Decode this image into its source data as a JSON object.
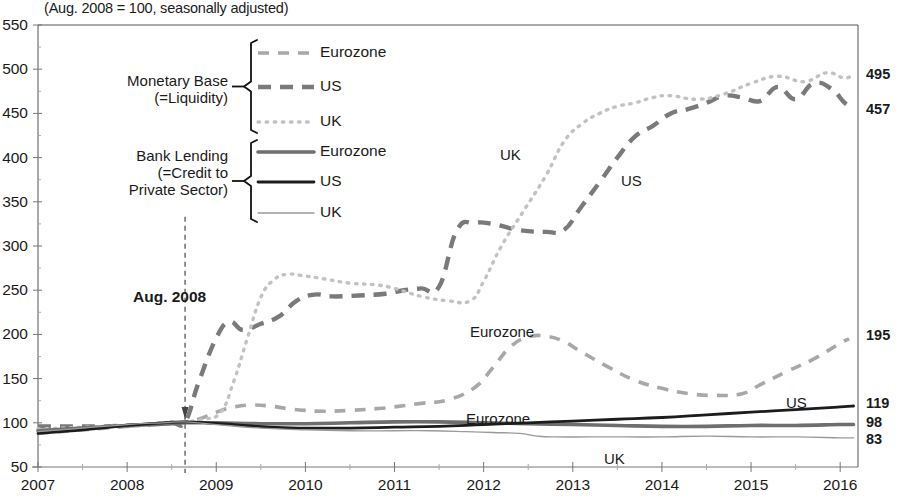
{
  "subtitle": "(Aug. 2008 = 100, seasonally adjusted)",
  "annotation": {
    "aug2008": "Aug. 2008"
  },
  "legend": {
    "groups": [
      {
        "name": "monetary-base",
        "line1": "Monetary Base",
        "line2": "(=Liquidity)",
        "line3": "",
        "items": [
          {
            "label": "Eurozone",
            "style": "dashed-light"
          },
          {
            "label": "US",
            "style": "dashed-medium"
          },
          {
            "label": "UK",
            "style": "dotted-light"
          }
        ]
      },
      {
        "name": "bank-lending",
        "line1": "Bank Lending",
        "line2": "(=Credit to",
        "line3": "Private Sector)",
        "items": [
          {
            "label": "Eurozone",
            "style": "solid-thick-grey"
          },
          {
            "label": "US",
            "style": "solid-thick-dark"
          },
          {
            "label": "UK",
            "style": "solid-thin-grey"
          }
        ]
      }
    ]
  },
  "inline_labels": [
    {
      "text": "UK",
      "x": 500,
      "y": 146
    },
    {
      "text": "US",
      "x": 621,
      "y": 172
    },
    {
      "text": "Eurozone",
      "x": 470,
      "y": 323
    },
    {
      "text": "Eurozone",
      "x": 466,
      "y": 410
    },
    {
      "text": "US",
      "x": 786,
      "y": 394
    },
    {
      "text": "UK",
      "x": 604,
      "y": 450
    }
  ],
  "right_labels": [
    {
      "value": "495",
      "y": 75
    },
    {
      "value": "457",
      "y": 110
    },
    {
      "value": "195",
      "y": 336
    },
    {
      "value": "119",
      "y": 404
    },
    {
      "value": "98",
      "y": 423
    },
    {
      "value": "83",
      "y": 440
    }
  ],
  "chart_data": {
    "type": "line",
    "title": "",
    "subtitle": "(Aug. 2008 = 100, seasonally adjusted)",
    "xlabel": "",
    "ylabel": "",
    "xlim": [
      2007.0,
      2016.2
    ],
    "ylim": [
      50,
      550
    ],
    "yticks": [
      50,
      100,
      150,
      200,
      250,
      300,
      350,
      400,
      450,
      500,
      550
    ],
    "xticks": [
      2007,
      2008,
      2009,
      2010,
      2011,
      2012,
      2013,
      2014,
      2015,
      2016
    ],
    "grid": false,
    "legend_position": "inside-upper-left",
    "vline": {
      "x": 2008.65,
      "label": "Aug. 2008"
    },
    "series": [
      {
        "name": "Monetary Base Eurozone",
        "group": "Monetary Base (=Liquidity)",
        "region": "Eurozone",
        "style": "dashed-light",
        "end_value": 195,
        "x": [
          2007.0,
          2007.25,
          2007.5,
          2007.75,
          2008.0,
          2008.25,
          2008.5,
          2008.65,
          2008.8,
          2009.0,
          2009.2,
          2009.4,
          2009.6,
          2009.8,
          2010.0,
          2010.2,
          2010.5,
          2010.8,
          2011.0,
          2011.3,
          2011.6,
          2011.9,
          2012.1,
          2012.3,
          2012.5,
          2012.7,
          2012.9,
          2013.1,
          2013.4,
          2013.7,
          2014.0,
          2014.3,
          2014.6,
          2014.9,
          2015.1,
          2015.4,
          2015.7,
          2016.0,
          2016.1
        ],
        "y": [
          88,
          90,
          92,
          94,
          96,
          98,
          100,
          101,
          104,
          112,
          118,
          120,
          119,
          116,
          114,
          113,
          114,
          116,
          118,
          122,
          126,
          140,
          162,
          186,
          197,
          198,
          192,
          180,
          163,
          148,
          139,
          133,
          131,
          133,
          143,
          158,
          172,
          190,
          195
        ]
      },
      {
        "name": "Monetary Base US",
        "group": "Monetary Base (=Liquidity)",
        "region": "US",
        "style": "dashed-medium",
        "end_value": 457,
        "x": [
          2007.0,
          2007.25,
          2007.5,
          2007.75,
          2008.0,
          2008.25,
          2008.5,
          2008.65,
          2008.8,
          2009.0,
          2009.15,
          2009.3,
          2009.5,
          2009.7,
          2009.9,
          2010.1,
          2010.3,
          2010.6,
          2010.9,
          2011.1,
          2011.3,
          2011.5,
          2011.7,
          2011.9,
          2012.1,
          2012.4,
          2012.7,
          2012.9,
          2013.1,
          2013.3,
          2013.5,
          2013.7,
          2013.9,
          2014.1,
          2014.3,
          2014.5,
          2014.7,
          2014.9,
          2015.1,
          2015.3,
          2015.5,
          2015.7,
          2015.9,
          2016.05,
          2016.15
        ],
        "y": [
          96,
          96,
          96,
          96,
          97,
          98,
          100,
          101,
          145,
          196,
          214,
          205,
          212,
          220,
          238,
          245,
          243,
          244,
          246,
          250,
          252,
          254,
          318,
          326,
          325,
          318,
          316,
          318,
          345,
          372,
          400,
          424,
          436,
          450,
          455,
          462,
          470,
          468,
          464,
          480,
          466,
          484,
          478,
          462,
          457
        ]
      },
      {
        "name": "Monetary Base UK",
        "group": "Monetary Base (=Liquidity)",
        "region": "UK",
        "style": "dotted-light",
        "end_value": 495,
        "x": [
          2007.0,
          2007.25,
          2007.5,
          2007.75,
          2008.0,
          2008.25,
          2008.5,
          2008.65,
          2008.85,
          2009.05,
          2009.2,
          2009.35,
          2009.5,
          2009.65,
          2009.8,
          2010.0,
          2010.2,
          2010.5,
          2010.8,
          2011.0,
          2011.3,
          2011.6,
          2011.85,
          2012.0,
          2012.2,
          2012.45,
          2012.7,
          2012.9,
          2013.1,
          2013.3,
          2013.5,
          2013.7,
          2013.9,
          2014.1,
          2014.4,
          2014.7,
          2015.0,
          2015.3,
          2015.6,
          2015.85,
          2016.05,
          2016.15
        ],
        "y": [
          93,
          94,
          95,
          96,
          97,
          98,
          100,
          101,
          104,
          112,
          148,
          196,
          242,
          262,
          268,
          266,
          263,
          258,
          256,
          252,
          243,
          238,
          238,
          260,
          300,
          340,
          380,
          418,
          438,
          450,
          458,
          462,
          468,
          470,
          466,
          472,
          484,
          492,
          486,
          496,
          490,
          495
        ]
      },
      {
        "name": "Bank Lending Eurozone",
        "group": "Bank Lending (=Credit to Private Sector)",
        "region": "Eurozone",
        "style": "solid-thick-grey",
        "end_value": 98,
        "x": [
          2007.0,
          2007.5,
          2008.0,
          2008.5,
          2008.65,
          2009.0,
          2009.5,
          2010.0,
          2010.5,
          2011.0,
          2011.5,
          2012.0,
          2012.5,
          2013.0,
          2013.5,
          2014.0,
          2014.5,
          2015.0,
          2015.5,
          2016.0,
          2016.15
        ],
        "y": [
          91,
          94,
          97,
          99,
          100,
          100,
          99,
          99,
          100,
          101,
          101,
          100,
          99,
          98,
          97,
          96,
          96,
          97,
          97,
          98,
          98
        ]
      },
      {
        "name": "Bank Lending US",
        "group": "Bank Lending (=Credit to Private Sector)",
        "region": "US",
        "style": "solid-thick-dark",
        "end_value": 119,
        "x": [
          2007.0,
          2007.5,
          2008.0,
          2008.4,
          2008.65,
          2008.9,
          2009.2,
          2009.6,
          2010.0,
          2010.5,
          2011.0,
          2011.5,
          2012.0,
          2012.5,
          2013.0,
          2013.5,
          2014.0,
          2014.5,
          2015.0,
          2015.5,
          2016.0,
          2016.15
        ],
        "y": [
          88,
          92,
          97,
          100,
          101,
          100,
          98,
          95,
          94,
          94,
          95,
          96,
          98,
          100,
          102,
          104,
          106,
          109,
          112,
          115,
          118,
          119
        ]
      },
      {
        "name": "Bank Lending UK",
        "group": "Bank Lending (=Credit to Private Sector)",
        "region": "UK",
        "style": "solid-thin-grey",
        "end_value": 83,
        "x": [
          2007.0,
          2007.5,
          2008.0,
          2008.4,
          2008.65,
          2009.0,
          2009.5,
          2010.0,
          2010.5,
          2011.0,
          2011.4,
          2011.8,
          2012.1,
          2012.4,
          2012.6,
          2012.8,
          2013.2,
          2013.6,
          2014.0,
          2014.5,
          2015.0,
          2015.5,
          2016.0,
          2016.15
        ],
        "y": [
          90,
          94,
          98,
          100,
          101,
          98,
          94,
          92,
          91,
          91,
          91,
          90,
          89,
          88,
          85,
          84,
          84,
          84,
          84,
          85,
          84,
          84,
          83,
          83
        ]
      }
    ]
  }
}
